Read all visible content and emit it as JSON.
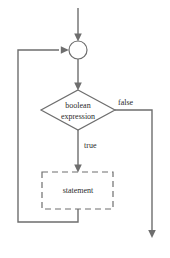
{
  "diagram": {
    "colors": {
      "line": "#6e6e6e",
      "text": "#2b2b2b",
      "background": "#ffffff"
    },
    "nodes": {
      "merge": {
        "shape": "circle",
        "label": "",
        "cx": 78,
        "cy": 50,
        "r": 9
      },
      "condition": {
        "shape": "diamond",
        "label_line1": "boolean",
        "label_line2": "expression",
        "cx": 78,
        "cy": 110,
        "half_width": 37,
        "half_height": 20
      },
      "body": {
        "shape": "rectangle-dashed",
        "label": "statement",
        "x": 42,
        "y": 172,
        "width": 71,
        "height": 37
      }
    },
    "edges": [
      {
        "name": "entry-to-merge",
        "label": ""
      },
      {
        "name": "merge-to-condition",
        "label": ""
      },
      {
        "name": "condition-true-to-body",
        "label": "true"
      },
      {
        "name": "condition-false-to-exit",
        "label": "false"
      },
      {
        "name": "body-back-to-merge",
        "label": ""
      }
    ],
    "labels": {
      "true": "true",
      "false": "false"
    }
  }
}
